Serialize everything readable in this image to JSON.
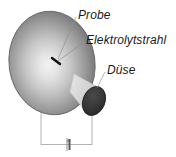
{
  "figure": {
    "background_color": "#ffffff",
    "labels": {
      "sample": "Probe",
      "jet": "Elektrolytstrahl",
      "nozzle": "Düse",
      "gap_dimension": "a"
    },
    "colors": {
      "sample_center": "#ededed",
      "sample_edge": "#6e6e6e",
      "sample_outline": "#4a4a4a",
      "jet_cone": "#d2d2d2",
      "nozzle_face": "#333333",
      "nozzle_outline": "#2a2a2a",
      "leader_line": "#8a8a8a",
      "dimension_line": "#b0b0b0",
      "impact_point": "#111111",
      "text": "#1a1a1a"
    },
    "elements": {
      "sample_shape": "ellipse",
      "jet_shape": "cone",
      "nozzle_shape": "ellipse",
      "dimension_shape": "bracket"
    }
  }
}
